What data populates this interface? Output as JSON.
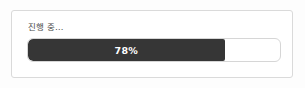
{
  "panel": {
    "status_label": "진행 중…"
  },
  "progress": {
    "value_text": "78%",
    "percent": 78,
    "min": 0,
    "max": 100,
    "fill_color": "#363636",
    "track_color": "#ffffff",
    "track_border_color": "#d6d6d6",
    "value_text_color": "#ffffff",
    "label_color": "#4a4a4a"
  }
}
